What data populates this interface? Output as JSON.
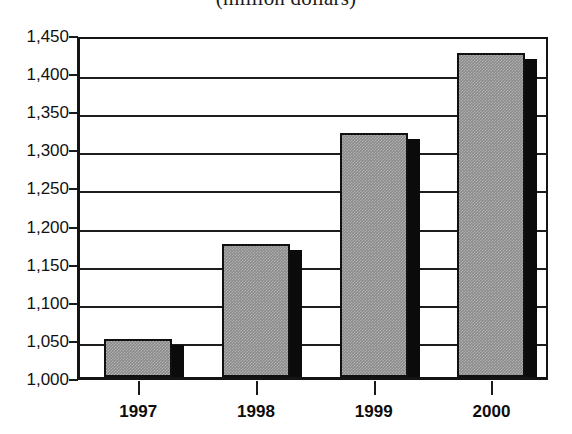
{
  "chart_data": {
    "type": "bar",
    "title": "(million dollars)",
    "subtitle": "",
    "xlabel": "",
    "ylabel": "",
    "categories": [
      "1997",
      "1998",
      "1999",
      "2000"
    ],
    "values": [
      1050,
      1175,
      1320,
      1425
    ],
    "ylim": [
      1000,
      1450
    ],
    "ytick_step": 50,
    "ytick_labels": [
      "1,450",
      "1,400",
      "1,350",
      "1,300",
      "1,250",
      "1,200",
      "1,150",
      "1,100",
      "1,050",
      "1,000"
    ],
    "ytick_values": [
      1450,
      1400,
      1350,
      1300,
      1250,
      1200,
      1150,
      1100,
      1050,
      1000
    ],
    "grid": true,
    "grid_axis": "y",
    "legend": false,
    "legend_position": "none",
    "series": [
      {
        "name": "",
        "values": [
          1050,
          1175,
          1320,
          1425
        ],
        "fill_color": "#8a8a8a",
        "edge_color": "#101010",
        "shadow_color": "#0b0b0b"
      }
    ],
    "colors": {
      "bar_fill": "#8a8a8a",
      "bar_edge": "#101010",
      "bar_shadow": "#0b0b0b",
      "axis": "#141414",
      "gridline": "#1d1d1d",
      "text": "#111111",
      "background": "#ffffff"
    }
  },
  "axes": {
    "y": {
      "ticks": [
        {
          "label": "1,450",
          "value": 1450
        },
        {
          "label": "1,400",
          "value": 1400
        },
        {
          "label": "1,350",
          "value": 1350
        },
        {
          "label": "1,300",
          "value": 1300
        },
        {
          "label": "1,250",
          "value": 1250
        },
        {
          "label": "1,200",
          "value": 1200
        },
        {
          "label": "1,150",
          "value": 1150
        },
        {
          "label": "1,100",
          "value": 1100
        },
        {
          "label": "1,050",
          "value": 1050
        },
        {
          "label": "1,000",
          "value": 1000
        }
      ]
    },
    "x": {
      "ticks": [
        {
          "label": "1997"
        },
        {
          "label": "1998"
        },
        {
          "label": "1999"
        },
        {
          "label": "2000"
        }
      ]
    }
  }
}
